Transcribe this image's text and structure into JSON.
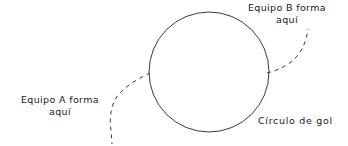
{
  "diagram": {
    "background_color": "#ffffff",
    "stroke_color": "#3a3a3a",
    "text_color": "#1a1a1a",
    "labels": {
      "team_b": {
        "line1": "Equipo B forma",
        "line2": "aquí"
      },
      "team_a": {
        "line1": "Equipo A forma",
        "line2": "aquí"
      },
      "goal_circle": "Círculo de gol"
    },
    "shapes": {
      "circle": {
        "name": "goal-circle",
        "center_x": 209,
        "center_y": 72,
        "radius": 60,
        "stroke_width": 1,
        "fill": "none"
      },
      "dashed_path_left": {
        "name": "team-a-path",
        "dash": "4 4",
        "start_x": 150,
        "start_y": 73,
        "end_x": 112,
        "end_y": 144
      },
      "dashed_path_right": {
        "name": "team-b-path",
        "dash": "4 4",
        "start_x": 267,
        "start_y": 73,
        "end_x": 308,
        "end_y": 29
      }
    }
  }
}
